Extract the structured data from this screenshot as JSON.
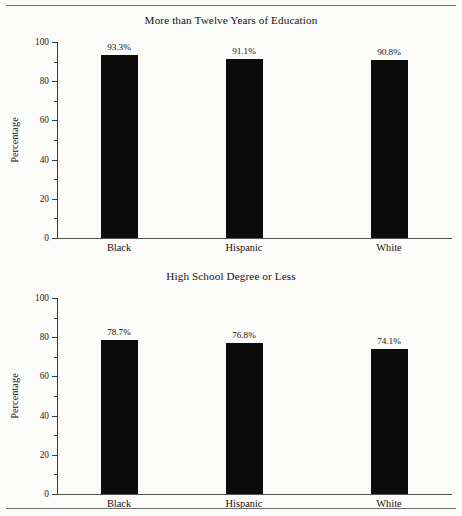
{
  "figure": {
    "background_color": "#fbfbfa",
    "bar_color": "#0b0b0b",
    "axis_color": "#3a3a3a",
    "rule_color": "#6f6f6f"
  },
  "chart_data": [
    {
      "type": "bar",
      "title": "More than Twelve Years of Education",
      "xlabel": "",
      "ylabel": "Percentage",
      "categories": [
        "Black",
        "Hispanic",
        "White"
      ],
      "values": [
        93.3,
        91.1,
        90.8
      ],
      "value_labels": [
        "93.3%",
        "91.1%",
        "90.8%"
      ],
      "ylim": [
        0,
        100
      ],
      "yticks": [
        0,
        20,
        40,
        60,
        80,
        100
      ],
      "ytick_labels": [
        "0",
        "20",
        "40",
        "60",
        "80",
        "100"
      ],
      "yminor_ticks": [
        10,
        30,
        50,
        70,
        90
      ],
      "grid": false,
      "legend": false
    },
    {
      "type": "bar",
      "title": "High School Degree or Less",
      "xlabel": "",
      "ylabel": "Percentage",
      "categories": [
        "Black",
        "Hispanic",
        "White"
      ],
      "values": [
        78.7,
        76.8,
        74.1
      ],
      "value_labels": [
        "78.7%",
        "76.8%",
        "74.1%"
      ],
      "ylim": [
        0,
        100
      ],
      "yticks": [
        0,
        20,
        40,
        60,
        80,
        100
      ],
      "ytick_labels": [
        "0",
        "20",
        "40",
        "60",
        "80",
        "100"
      ],
      "yminor_ticks": [
        10,
        30,
        50,
        70,
        90
      ],
      "grid": false,
      "legend": false
    }
  ]
}
